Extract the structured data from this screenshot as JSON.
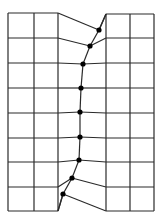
{
  "diagram": {
    "colors": {
      "line": "#2a2a2a",
      "node": "#000000",
      "background": "#ffffff"
    },
    "left_block": {
      "x": [
        8,
        34,
        58
      ],
      "y": [
        13,
        38,
        63,
        88,
        113,
        138,
        162,
        187,
        211
      ]
    },
    "right_block": {
      "x": [
        106,
        130,
        154
      ],
      "y": [
        14,
        38,
        63,
        88,
        113,
        138,
        162,
        187,
        211
      ]
    },
    "crack_nodes": [
      [
        99,
        30
      ],
      [
        90,
        46
      ],
      [
        83,
        64
      ],
      [
        81,
        88
      ],
      [
        80,
        112
      ],
      [
        80,
        137
      ],
      [
        79,
        160
      ],
      [
        72,
        178
      ],
      [
        63,
        194
      ]
    ],
    "connectors": [
      [
        [
          58,
          13
        ],
        [
          99,
          30
        ]
      ],
      [
        [
          106,
          14
        ],
        [
          99,
          30
        ]
      ],
      [
        [
          58,
          38
        ],
        [
          90,
          46
        ]
      ],
      [
        [
          106,
          38
        ],
        [
          90,
          46
        ]
      ],
      [
        [
          58,
          63
        ],
        [
          83,
          64
        ]
      ],
      [
        [
          106,
          63
        ],
        [
          83,
          64
        ]
      ],
      [
        [
          58,
          88
        ],
        [
          81,
          88
        ]
      ],
      [
        [
          106,
          88
        ],
        [
          81,
          88
        ]
      ],
      [
        [
          58,
          113
        ],
        [
          80,
          112
        ]
      ],
      [
        [
          106,
          113
        ],
        [
          80,
          112
        ]
      ],
      [
        [
          58,
          138
        ],
        [
          80,
          137
        ]
      ],
      [
        [
          106,
          138
        ],
        [
          80,
          137
        ]
      ],
      [
        [
          58,
          162
        ],
        [
          79,
          160
        ]
      ],
      [
        [
          106,
          162
        ],
        [
          79,
          160
        ]
      ],
      [
        [
          58,
          187
        ],
        [
          72,
          178
        ]
      ],
      [
        [
          106,
          187
        ],
        [
          72,
          178
        ]
      ],
      [
        [
          58,
          211
        ],
        [
          63,
          194
        ]
      ],
      [
        [
          106,
          211
        ],
        [
          63,
          194
        ]
      ]
    ]
  }
}
